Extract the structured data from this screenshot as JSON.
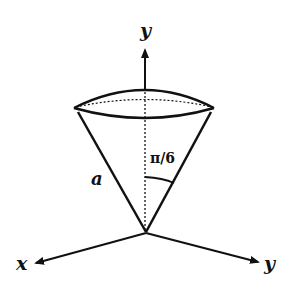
{
  "diagram": {
    "type": "cone-with-spherical-cap",
    "labels": {
      "axis_vertical": "y",
      "axis_left": "x",
      "axis_right": "y",
      "slant_length": "a",
      "half_angle": "π/6"
    },
    "colors": {
      "stroke": "#111111",
      "background": "#ffffff"
    }
  }
}
